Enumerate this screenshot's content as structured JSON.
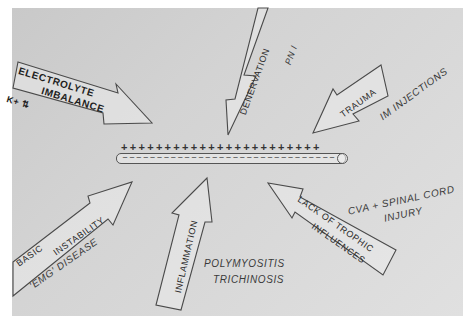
{
  "figure": {
    "type": "causes-of-muscle-fiber-membrane-instability",
    "center": {
      "plus_signs": "+++++++++++++++++++++++",
      "minus_signs": "‒‒‒‒‒‒‒‒‒‒‒‒‒‒‒‒‒‒‒‒‒‒‒‒‒‒‒‒‒‒‒",
      "label": "muscle fiber membrane (polarized)"
    },
    "arrows": [
      {
        "id": "electrolyte",
        "text_line1": "ELECTROLYTE",
        "text_line2": "IMBALANCE",
        "note": "K+ ⇅",
        "direction": "toward-center"
      },
      {
        "id": "denervation",
        "text": "DENERVATION",
        "note": "PN I",
        "direction": "toward-center"
      },
      {
        "id": "trauma",
        "text": "TRAUMA",
        "note": "IM INJECTIONS",
        "direction": "toward-center"
      },
      {
        "id": "basic",
        "text_line1": "BASIC",
        "text_line2": "INSTABILITY",
        "note": "'EMG' DISEASE",
        "direction": "toward-center"
      },
      {
        "id": "inflammation",
        "text": "INFLAMMATION",
        "note_line1": "POLYMYOSITIS",
        "note_line2": "TRICHINOSIS",
        "direction": "toward-center"
      },
      {
        "id": "trophic",
        "text_line1": "LACK OF TROPHIC",
        "text_line2": "INFLUENCES",
        "note_line1": "CVA + SPINAL CORD",
        "note_line2": "INJURY",
        "direction": "toward-center"
      }
    ],
    "colors": {
      "background": "#d4d4d4",
      "outline": "#4a4a4a",
      "text": "#2a2a2a"
    }
  }
}
